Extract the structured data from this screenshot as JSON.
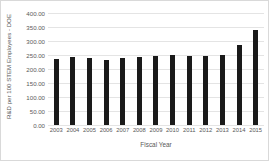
{
  "chart_data": {
    "type": "bar",
    "title": "",
    "xlabel": "Fiscal Year",
    "ylabel": "R&D per 100 STEM Employees - DOE",
    "categories": [
      "2003",
      "2004",
      "2005",
      "2006",
      "2007",
      "2008",
      "2009",
      "2010",
      "2011",
      "2012",
      "2013",
      "2014",
      "2015"
    ],
    "values": [
      236,
      243,
      238,
      232,
      240,
      243,
      248,
      250,
      245,
      248,
      249,
      287,
      339
    ],
    "ylim": [
      0,
      400
    ],
    "ytick_labels": [
      "0.00",
      "50.00",
      "100.00",
      "150.00",
      "200.00",
      "250.00",
      "300.00",
      "350.00",
      "400.00"
    ],
    "ytick_values": [
      0,
      50,
      100,
      150,
      200,
      250,
      300,
      350,
      400
    ],
    "grid": true,
    "legend": "none",
    "series": [
      {
        "name": "R&D per 100 STEM Employees - DOE",
        "color": "#1a1a1a",
        "values": [
          236,
          243,
          238,
          232,
          240,
          243,
          248,
          250,
          245,
          248,
          249,
          287,
          339
        ]
      }
    ]
  }
}
